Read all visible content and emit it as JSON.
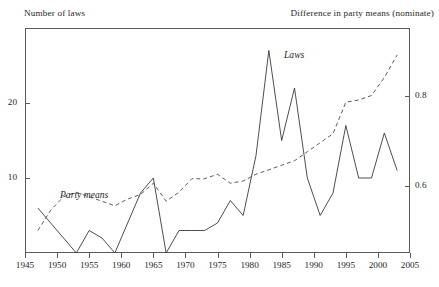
{
  "figure": {
    "left_axis_title": "Number of laws",
    "right_axis_title": "Difference in party means (nominate)"
  },
  "series_labels": {
    "laws": "Laws",
    "party_means": "Party means"
  },
  "axes": {
    "y_left_ticks": [
      "10",
      "20"
    ],
    "y_right_ticks": [
      "0.6",
      "0.8"
    ],
    "x_ticks": [
      "1945",
      "1950",
      "1955",
      "1960",
      "1965",
      "1970",
      "1975",
      "1980",
      "1985",
      "1990",
      "1995",
      "2000",
      "2005"
    ]
  },
  "chart_data": {
    "type": "line",
    "title": "",
    "xlabel": "",
    "ylabel": "Number of laws",
    "y2label": "Difference in party means (nominate)",
    "grid": false,
    "legend": "inline-annotations",
    "xlim": [
      1945,
      2005
    ],
    "ylim": [
      0,
      30
    ],
    "y2lim": [
      0.45,
      0.95
    ],
    "x_ticks": [
      1945,
      1950,
      1955,
      1960,
      1965,
      1970,
      1975,
      1980,
      1985,
      1990,
      1995,
      2000,
      2005
    ],
    "y_ticks": [
      10,
      20
    ],
    "y2_ticks": [
      0.6,
      0.8
    ],
    "series": [
      {
        "name": "Laws",
        "axis": "left",
        "style": "solid",
        "color": "#3a3a3a",
        "x": [
          1947,
          1949,
          1951,
          1953,
          1955,
          1957,
          1959,
          1961,
          1963,
          1965,
          1967,
          1969,
          1971,
          1973,
          1975,
          1977,
          1979,
          1981,
          1983,
          1985,
          1987,
          1989,
          1991,
          1993,
          1995,
          1997,
          1999,
          2001,
          2003
        ],
        "values": [
          6,
          4,
          2,
          0,
          3,
          2,
          0,
          4,
          8,
          10,
          0,
          3,
          3,
          3,
          4,
          7,
          5,
          13,
          27,
          15,
          22,
          10,
          5,
          8,
          17,
          10,
          10,
          16,
          11
        ]
      },
      {
        "name": "Party means",
        "axis": "right",
        "style": "dashed",
        "color": "#4a4a4a",
        "x": [
          1947,
          1949,
          1951,
          1953,
          1955,
          1957,
          1959,
          1961,
          1963,
          1965,
          1967,
          1969,
          1971,
          1973,
          1975,
          1977,
          1979,
          1981,
          1983,
          1985,
          1987,
          1989,
          1991,
          1993,
          1995,
          1997,
          1999,
          2001,
          2003
        ],
        "values": [
          0.5,
          0.545,
          0.575,
          0.585,
          0.575,
          0.565,
          0.555,
          0.57,
          0.58,
          0.605,
          0.565,
          0.585,
          0.615,
          0.615,
          0.625,
          0.605,
          0.61,
          0.625,
          0.635,
          0.645,
          0.655,
          0.675,
          0.695,
          0.715,
          0.785,
          0.79,
          0.8,
          0.84,
          0.89
        ]
      }
    ]
  }
}
